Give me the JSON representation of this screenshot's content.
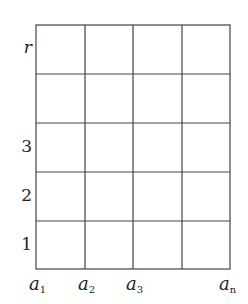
{
  "diagram": {
    "type": "grid",
    "columns": 4,
    "rows": 5,
    "line_color": "#444444",
    "background": "#ffffff",
    "row_labels": [
      {
        "text": "r",
        "italic": true,
        "row_from_top": 0
      },
      {
        "text": "3",
        "italic": false,
        "row_from_top": 2
      },
      {
        "text": "2",
        "italic": false,
        "row_from_top": 3
      },
      {
        "text": "1",
        "italic": false,
        "row_from_top": 4
      }
    ],
    "column_labels": [
      {
        "base": "a",
        "sub": "1",
        "line_index": 0
      },
      {
        "base": "a",
        "sub": "2",
        "line_index": 1
      },
      {
        "base": "a",
        "sub": "3",
        "line_index": 2
      },
      {
        "base": "a",
        "sub": "n",
        "line_index": 4
      }
    ]
  }
}
